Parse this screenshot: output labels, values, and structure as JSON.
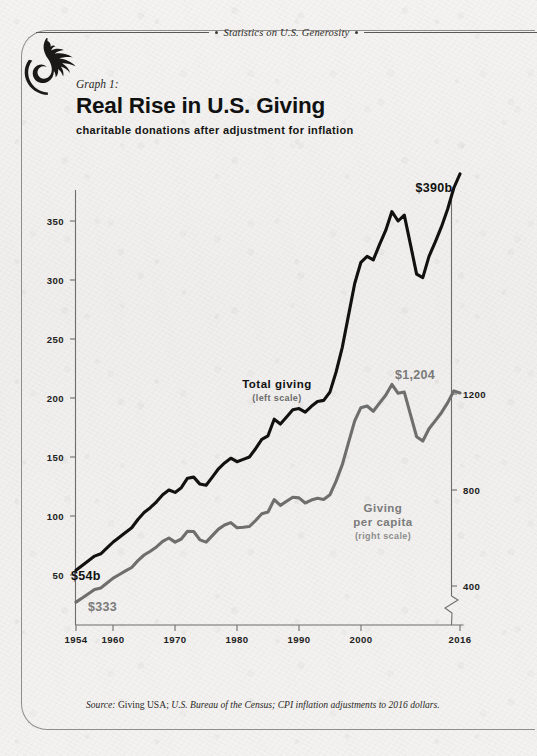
{
  "running_head": "Statistics on U.S. Generosity",
  "graph_label": "Graph 1:",
  "title": "Real Rise in U.S. Giving",
  "subtitle": "charitable donations after adjustment for inflation",
  "source": {
    "word": "Source:",
    "plain": "Giving USA;",
    "italic": "U.S. Bureau of the Census; CPI inflation adjustments to 2016 dollars."
  },
  "annotations": {
    "total_end": "$390b",
    "total_start": "$54b",
    "percap_end": "$1,204",
    "percap_start": "$333",
    "total_label": "Total giving",
    "total_scale": "(left scale)",
    "percap_label_line1": "Giving",
    "percap_label_line2": "per capita",
    "percap_scale": "(right scale)"
  },
  "colors": {
    "total_line": "#111111",
    "percap_line": "#6e6e6e",
    "axis": "#6f6d6a",
    "paper": "#f2f1ef"
  },
  "chart_data": {
    "type": "line",
    "title": "Real Rise in U.S. Giving",
    "subtitle": "charitable donations after adjustment for inflation",
    "xlabel": "",
    "ylabel": "",
    "grid": false,
    "legend": "inline-annotations",
    "x": [
      1954,
      1955,
      1956,
      1957,
      1958,
      1959,
      1960,
      1961,
      1962,
      1963,
      1964,
      1965,
      1966,
      1967,
      1968,
      1969,
      1970,
      1971,
      1972,
      1973,
      1974,
      1975,
      1976,
      1977,
      1978,
      1979,
      1980,
      1981,
      1982,
      1983,
      1984,
      1985,
      1986,
      1987,
      1988,
      1989,
      1990,
      1991,
      1992,
      1993,
      1994,
      1995,
      1996,
      1997,
      1998,
      1999,
      2000,
      2001,
      2002,
      2003,
      2004,
      2005,
      2006,
      2007,
      2008,
      2009,
      2010,
      2011,
      2012,
      2013,
      2014,
      2015,
      2016
    ],
    "xtick_labels": [
      "1954",
      "1960",
      "1970",
      "1980",
      "1990",
      "2000",
      "2016"
    ],
    "xticks": [
      1954,
      1960,
      1970,
      1980,
      1990,
      2000,
      2016
    ],
    "axes": [
      {
        "name": "left",
        "label": "Total giving (left scale)",
        "unit": "billions of 2016 dollars",
        "ticks": [
          50,
          100,
          150,
          200,
          250,
          300,
          350
        ],
        "ylim": [
          25,
          400
        ]
      },
      {
        "name": "right",
        "label": "Giving per capita (right scale)",
        "unit": "2016 dollars",
        "ticks": [
          400,
          800,
          1200
        ],
        "ylim": [
          200,
          1320
        ],
        "axis_break": true
      }
    ],
    "series": [
      {
        "name": "Total giving",
        "axis": "left",
        "color": "#111111",
        "start_label": "$54b",
        "end_label": "$390b",
        "values": [
          54,
          58,
          62,
          66,
          68,
          73,
          78,
          82,
          86,
          90,
          97,
          103,
          107,
          112,
          118,
          122,
          120,
          124,
          132,
          133,
          127,
          126,
          133,
          140,
          145,
          149,
          146,
          148,
          150,
          157,
          165,
          168,
          182,
          178,
          184,
          190,
          191,
          188,
          193,
          197,
          198,
          205,
          222,
          243,
          270,
          297,
          315,
          320,
          317,
          330,
          342,
          358,
          350,
          355,
          330,
          305,
          302,
          320,
          332,
          345,
          360,
          378,
          390
        ]
      },
      {
        "name": "Giving per capita",
        "axis": "right",
        "color": "#6e6e6e",
        "start_label": "$333",
        "end_label": "$1,204",
        "values": [
          333,
          350,
          368,
          386,
          392,
          412,
          433,
          448,
          463,
          477,
          506,
          529,
          545,
          563,
          586,
          600,
          583,
          596,
          628,
          627,
          592,
          583,
          610,
          637,
          654,
          664,
          643,
          645,
          648,
          673,
          701,
          708,
          760,
          736,
          753,
          770,
          767,
          746,
          758,
          766,
          761,
          780,
          837,
          906,
          997,
          1088,
          1143,
          1150,
          1128,
          1162,
          1195,
          1240,
          1203,
          1208,
          1114,
          1022,
          1004,
          1055,
          1088,
          1122,
          1163,
          1213,
          1204
        ]
      }
    ]
  }
}
